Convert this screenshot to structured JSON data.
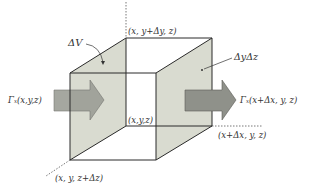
{
  "diagram": {
    "type": "control-volume-cube",
    "colors": {
      "face_fill": "#d9dbd0",
      "edge": "#2a2a2a",
      "arrow_fill": "#8f918a",
      "arrow_stroke": "#5a5a55",
      "arrow_left_fill": "#9c9e96",
      "dotted": "#555555",
      "text": "#333333",
      "background": "#ffffff"
    },
    "labels": {
      "delta_v": "ΔV",
      "top_corner": "(x, y+Δy, z)",
      "face_area": "ΔyΔz",
      "flux_in": "Γₓ(x,y,z)",
      "flux_out": "Γₓ(x+Δx, y, z)",
      "origin": "(x,y,z)",
      "x_corner": "(x+Δx, y, z)",
      "z_corner": "(x, y, z+Δz)"
    }
  }
}
